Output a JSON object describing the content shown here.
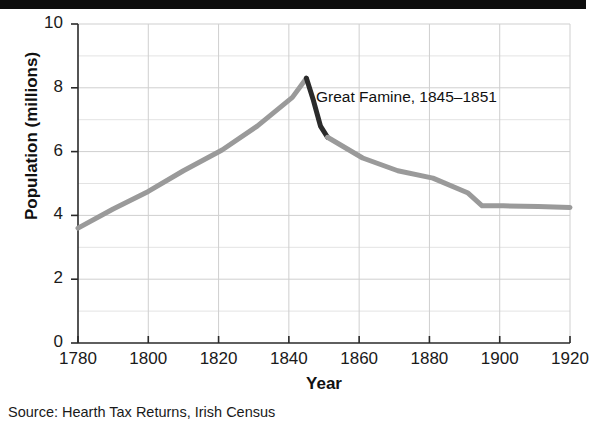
{
  "figure": {
    "title_band_text": "",
    "source": "Source:  Hearth Tax Returns, Irish Census",
    "annotation": "Great Famine, 1845–1851"
  },
  "chart_data": {
    "type": "line",
    "title": "",
    "xlabel": "Year",
    "ylabel": "Population (millions)",
    "xlim": [
      1780,
      1920
    ],
    "ylim": [
      0,
      10
    ],
    "xticks": [
      1780,
      1800,
      1820,
      1840,
      1860,
      1880,
      1900,
      1920
    ],
    "yticks": [
      0,
      2,
      4,
      6,
      8,
      10
    ],
    "xtick_labels": [
      "1780",
      "1800",
      "1820",
      "1840",
      "1860",
      "1880",
      "1900",
      "1920"
    ],
    "ytick_labels": [
      "0",
      "2",
      "4",
      "6",
      "8",
      "10"
    ],
    "grid": true,
    "grid_minor_y": [
      1,
      3,
      5,
      7,
      9
    ],
    "legend": "none",
    "annotations": [
      {
        "text": "Great Famine, 1845–1851",
        "x": 1851,
        "y": 7.5
      }
    ],
    "series": [
      {
        "name": "Population of Ireland",
        "color": "#9a9a9a",
        "linewidth": 5,
        "x": [
          1780,
          1790,
          1800,
          1810,
          1821,
          1831,
          1841,
          1845
        ],
        "values": [
          3.6,
          4.2,
          4.75,
          5.4,
          6.05,
          6.8,
          7.7,
          8.3
        ]
      },
      {
        "name": "Great Famine decline",
        "color": "#2b2b2b",
        "linewidth": 5,
        "x": [
          1845,
          1847,
          1849,
          1851
        ],
        "values": [
          8.3,
          7.6,
          6.8,
          6.45
        ]
      },
      {
        "name": "Post-famine decline",
        "color": "#9a9a9a",
        "linewidth": 5,
        "x": [
          1851,
          1861,
          1871,
          1881,
          1891,
          1895,
          1901,
          1911,
          1920
        ],
        "values": [
          6.45,
          5.8,
          5.4,
          5.17,
          4.7,
          4.3,
          4.3,
          4.28,
          4.25
        ]
      }
    ]
  },
  "axis": {
    "y_title": "Population (millions)",
    "x_title": "Year"
  }
}
